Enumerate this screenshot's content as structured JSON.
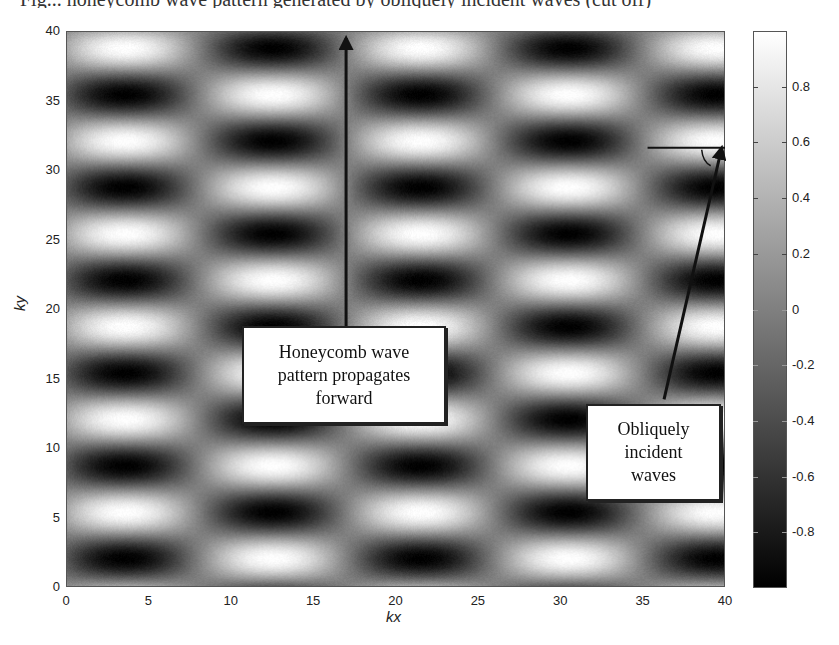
{
  "caption_fragment": "Fig... honeycomb wave pattern generated by obliquely incident waves (cut off)",
  "chart_data": {
    "type": "heatmap",
    "title": "",
    "xlabel": "kx",
    "ylabel": "ky",
    "xlim": [
      0,
      40
    ],
    "ylim": [
      0,
      40
    ],
    "x_ticks": [
      "0",
      "5",
      "10",
      "15",
      "20",
      "25",
      "30",
      "35",
      "40"
    ],
    "y_ticks": [
      "0",
      "5",
      "10",
      "15",
      "20",
      "25",
      "30",
      "35",
      "40"
    ],
    "colormap": "gray",
    "clim": [
      -1,
      1
    ],
    "colorbar_ticks": [
      "0.8",
      "0.6",
      "0.4",
      "0.2",
      "0",
      "-0.2",
      "-0.4",
      "-0.6",
      "-0.8"
    ],
    "field_model": {
      "formula": "z = -cos(2*pi*(kx - x0)/Lx) * cos(2*pi*(ky - y0)/Ly)",
      "Lx": 18,
      "x0": 3.5,
      "Ly": 6.7,
      "y0": 2.0
    },
    "annotations": [
      {
        "text": "Honeycomb wave pattern propagates forward",
        "arrow": {
          "from": [
            17,
            17.5
          ],
          "to": [
            17,
            39.5
          ],
          "direction": "up"
        }
      },
      {
        "text": "Obliquely incident waves",
        "arrow": {
          "from": [
            36.3,
            13.5
          ],
          "to": [
            39.8,
            31.6
          ],
          "direction": "up-right"
        },
        "reference_line": {
          "from": [
            35.3,
            31.6
          ],
          "to": [
            40,
            31.6
          ]
        }
      }
    ],
    "grid": false,
    "legend": "colorbar-right"
  },
  "notes": {
    "honeycomb": [
      "Honeycomb wave",
      "pattern propagates",
      "forward"
    ],
    "oblique": [
      "Obliquely",
      "incident",
      "waves"
    ]
  },
  "axes": {
    "xlabel": "kx",
    "ylabel": "ky"
  }
}
